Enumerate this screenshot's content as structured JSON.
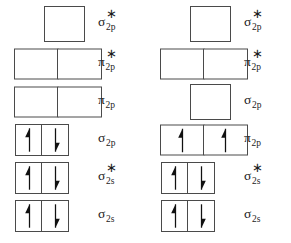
{
  "colors": {
    "background": "#ffffff",
    "box_border": "#4a4a4a",
    "arrow": "#111111",
    "text": "#1a1a1a"
  },
  "columns": [
    {
      "id": "left-diagram",
      "name": "mo-diagram-left",
      "rows": [
        {
          "id": "left-row-1",
          "orbital": "sigma-2p-star",
          "label": {
            "symbol": "σ",
            "subscript": "2p",
            "antibonding": true,
            "text": "σ*2p"
          },
          "box_count": 1,
          "box_style": "square",
          "electrons": []
        },
        {
          "id": "left-row-2",
          "orbital": "pi-2p-star",
          "label": {
            "symbol": "π",
            "subscript": "2p",
            "antibonding": true,
            "text": "π*2p"
          },
          "box_count": 2,
          "box_style": "wide",
          "electrons": [
            [],
            []
          ]
        },
        {
          "id": "left-row-3",
          "orbital": "pi-2p",
          "label": {
            "symbol": "π",
            "subscript": "2p",
            "antibonding": false,
            "text": "π2p"
          },
          "box_count": 2,
          "box_style": "wide",
          "electrons": [
            [],
            []
          ]
        },
        {
          "id": "left-row-4",
          "orbital": "sigma-2p",
          "label": {
            "symbol": "σ",
            "subscript": "2p",
            "antibonding": false,
            "text": "σ2p"
          },
          "box_count": 2,
          "box_style": "slim",
          "electrons": [
            [
              "up"
            ],
            [
              "down"
            ]
          ]
        },
        {
          "id": "left-row-5",
          "orbital": "sigma-2s-star",
          "label": {
            "symbol": "σ",
            "subscript": "2s",
            "antibonding": true,
            "text": "σ*2s"
          },
          "box_count": 2,
          "box_style": "slim",
          "electrons": [
            [
              "up"
            ],
            [
              "down"
            ]
          ]
        },
        {
          "id": "left-row-6",
          "orbital": "sigma-2s",
          "label": {
            "symbol": "σ",
            "subscript": "2s",
            "antibonding": false,
            "text": "σ2s"
          },
          "box_count": 2,
          "box_style": "slim",
          "electrons": [
            [
              "up"
            ],
            [
              "down"
            ]
          ]
        }
      ]
    },
    {
      "id": "right-diagram",
      "name": "mo-diagram-right",
      "rows": [
        {
          "id": "right-row-1",
          "orbital": "sigma-2p-star",
          "label": {
            "symbol": "σ",
            "subscript": "2p",
            "antibonding": true,
            "text": "σ*2p"
          },
          "box_count": 1,
          "box_style": "square",
          "electrons": []
        },
        {
          "id": "right-row-2",
          "orbital": "pi-2p-star",
          "label": {
            "symbol": "π",
            "subscript": "2p",
            "antibonding": true,
            "text": "π*2p"
          },
          "box_count": 2,
          "box_style": "wide",
          "electrons": [
            [],
            []
          ]
        },
        {
          "id": "right-row-3",
          "orbital": "sigma-2p",
          "label": {
            "symbol": "σ",
            "subscript": "2p",
            "antibonding": false,
            "text": "σ2p"
          },
          "box_count": 1,
          "box_style": "square",
          "electrons": []
        },
        {
          "id": "right-row-4",
          "orbital": "pi-2p",
          "label": {
            "symbol": "π",
            "subscript": "2p",
            "antibonding": false,
            "text": "π2p"
          },
          "box_count": 2,
          "box_style": "wide",
          "electrons": [
            [
              "up"
            ],
            [
              "up"
            ]
          ]
        },
        {
          "id": "right-row-5",
          "orbital": "sigma-2s-star",
          "label": {
            "symbol": "σ",
            "subscript": "2s",
            "antibonding": true,
            "text": "σ*2s"
          },
          "box_count": 2,
          "box_style": "slim",
          "electrons": [
            [
              "up"
            ],
            [
              "down"
            ]
          ]
        },
        {
          "id": "right-row-6",
          "orbital": "sigma-2s",
          "label": {
            "symbol": "σ",
            "subscript": "2s",
            "antibonding": false,
            "text": "σ2s"
          },
          "box_count": 2,
          "box_style": "slim",
          "electrons": [
            [
              "up"
            ],
            [
              "down"
            ]
          ]
        }
      ]
    }
  ]
}
